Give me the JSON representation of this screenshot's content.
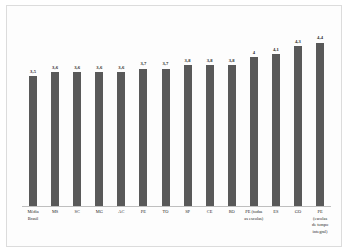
{
  "chart_data": {
    "type": "bar",
    "title": "",
    "subtitle": "",
    "xlabel": "",
    "ylabel": "",
    "ylim": [
      0,
      4.9
    ],
    "grid": false,
    "legend": "none",
    "bar_color": "#595959",
    "frame_color": "#dcdcdc",
    "axis_color": "#bfbfbf",
    "categories": [
      "Média Brasil",
      "MS",
      "SC",
      "MG",
      "AC",
      "PE",
      "TO",
      "SP",
      "CE",
      "RO",
      "PE (todas as escolas)",
      "ES",
      "GO",
      "PE (escolas de tempo integral)"
    ],
    "category_lines": [
      [
        "Média",
        "Brasil"
      ],
      [
        "MS"
      ],
      [
        "SC"
      ],
      [
        "MG"
      ],
      [
        "AC"
      ],
      [
        "PE"
      ],
      [
        "TO"
      ],
      [
        "SP"
      ],
      [
        "CE"
      ],
      [
        "RO"
      ],
      [
        "PE (todas",
        "as escolas)"
      ],
      [
        "ES"
      ],
      [
        "GO"
      ],
      [
        "PE",
        "(escolas",
        "de tempo",
        "integral)"
      ]
    ],
    "values": [
      3.5,
      3.6,
      3.6,
      3.6,
      3.6,
      3.7,
      3.7,
      3.8,
      3.8,
      3.8,
      4.0,
      4.1,
      4.3,
      4.4
    ],
    "value_labels": [
      "3,5",
      "3,6",
      "3,6",
      "3,6",
      "3,6",
      "3,7",
      "3,7",
      "3,8",
      "3,8",
      "3,8",
      "4",
      "4,1",
      "4,3",
      "4,4"
    ]
  }
}
